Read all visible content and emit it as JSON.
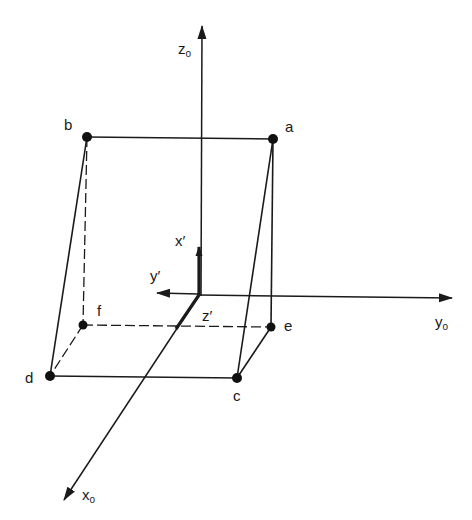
{
  "diagram": {
    "type": "3d-coordinate-frame-with-box",
    "colors": {
      "line": "#1a1a1a",
      "background": "#ffffff"
    },
    "axes": {
      "z0": {
        "label": "z",
        "subscript": "o"
      },
      "y0": {
        "label": "y",
        "subscript": "o"
      },
      "x0": {
        "label": "x",
        "subscript": "o"
      },
      "x_prime": {
        "label": "x′"
      },
      "y_prime": {
        "label": "y′"
      },
      "z_prime": {
        "label": "z′"
      }
    },
    "vertices": {
      "a": "a",
      "b": "b",
      "c": "c",
      "d": "d",
      "e": "e",
      "f": "f"
    }
  }
}
